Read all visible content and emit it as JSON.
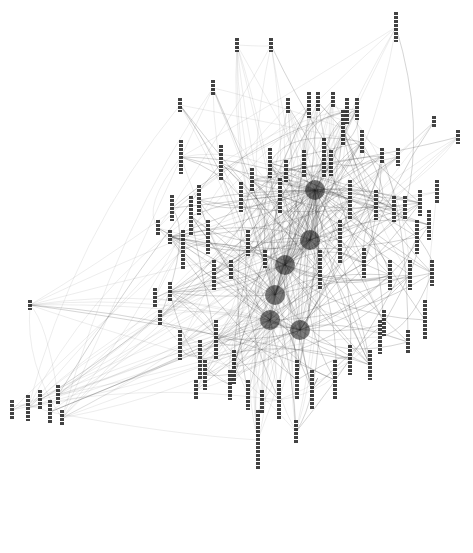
{
  "diagram": {
    "type": "network-graph",
    "orientation": "rotated-90",
    "label_note": "node labels are illegible rotated CJK text",
    "colors": {
      "background": "#ffffff",
      "edge": "#333333",
      "label": "#222222"
    },
    "hubs": [
      [
        315,
        190
      ],
      [
        310,
        240
      ],
      [
        285,
        265
      ],
      [
        275,
        295
      ],
      [
        270,
        320
      ],
      [
        300,
        330
      ]
    ],
    "nodes": [
      [
        396,
        12,
        30
      ],
      [
        271,
        38,
        14
      ],
      [
        237,
        38,
        14
      ],
      [
        213,
        80,
        16
      ],
      [
        180,
        98,
        14
      ],
      [
        181,
        140,
        34
      ],
      [
        221,
        145,
        36
      ],
      [
        288,
        98,
        16
      ],
      [
        309,
        92,
        26
      ],
      [
        318,
        92,
        20
      ],
      [
        333,
        92,
        16
      ],
      [
        347,
        98,
        26
      ],
      [
        357,
        98,
        22
      ],
      [
        362,
        130,
        24
      ],
      [
        382,
        148,
        16
      ],
      [
        398,
        148,
        18
      ],
      [
        420,
        190,
        26
      ],
      [
        434,
        116,
        12
      ],
      [
        458,
        130,
        14
      ],
      [
        270,
        148,
        30
      ],
      [
        286,
        160,
        22
      ],
      [
        304,
        150,
        28
      ],
      [
        331,
        150,
        26
      ],
      [
        343,
        110,
        36
      ],
      [
        252,
        168,
        24
      ],
      [
        241,
        182,
        30
      ],
      [
        199,
        185,
        30
      ],
      [
        172,
        195,
        26
      ],
      [
        158,
        220,
        16
      ],
      [
        170,
        230,
        14
      ],
      [
        155,
        288,
        20
      ],
      [
        160,
        310,
        16
      ],
      [
        170,
        282,
        20
      ],
      [
        183,
        230,
        40
      ],
      [
        191,
        196,
        40
      ],
      [
        208,
        220,
        34
      ],
      [
        214,
        260,
        30
      ],
      [
        231,
        260,
        20
      ],
      [
        248,
        230,
        26
      ],
      [
        265,
        250,
        18
      ],
      [
        280,
        178,
        36
      ],
      [
        324,
        138,
        40
      ],
      [
        376,
        190,
        30
      ],
      [
        394,
        196,
        26
      ],
      [
        405,
        196,
        24
      ],
      [
        429,
        210,
        30
      ],
      [
        437,
        180,
        24
      ],
      [
        417,
        220,
        34
      ],
      [
        410,
        260,
        30
      ],
      [
        390,
        260,
        30
      ],
      [
        364,
        248,
        30
      ],
      [
        380,
        320,
        34
      ],
      [
        408,
        330,
        24
      ],
      [
        425,
        300,
        40
      ],
      [
        432,
        260,
        26
      ],
      [
        180,
        330,
        30
      ],
      [
        200,
        340,
        40
      ],
      [
        216,
        320,
        40
      ],
      [
        234,
        350,
        34
      ],
      [
        196,
        380,
        20
      ],
      [
        205,
        360,
        30
      ],
      [
        230,
        370,
        30
      ],
      [
        248,
        380,
        30
      ],
      [
        262,
        390,
        24
      ],
      [
        279,
        380,
        40
      ],
      [
        297,
        360,
        40
      ],
      [
        312,
        370,
        40
      ],
      [
        335,
        360,
        40
      ],
      [
        350,
        345,
        30
      ],
      [
        370,
        350,
        30
      ],
      [
        384,
        310,
        26
      ],
      [
        258,
        410,
        60
      ],
      [
        296,
        420,
        24
      ],
      [
        320,
        250,
        40
      ],
      [
        340,
        220,
        44
      ],
      [
        350,
        180,
        40
      ],
      [
        30,
        300,
        10
      ],
      [
        12,
        400,
        20
      ],
      [
        28,
        395,
        26
      ],
      [
        40,
        390,
        20
      ],
      [
        50,
        400,
        24
      ],
      [
        58,
        385,
        20
      ],
      [
        62,
        410,
        16
      ]
    ],
    "edge_count": 420
  }
}
